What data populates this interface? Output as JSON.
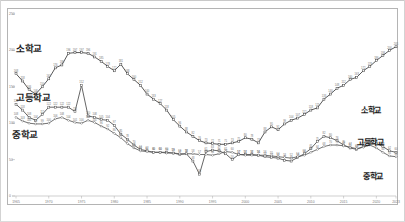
{
  "chart_data": {
    "type": "line",
    "title": "",
    "xlabel": "",
    "ylabel": "",
    "xlim": [
      1965,
      2023
    ],
    "ylim": [
      0,
      250
    ],
    "grid": false,
    "legend_position": "inline-endpoints",
    "x": [
      1965,
      1966,
      1967,
      1968,
      1969,
      1970,
      1971,
      1972,
      1973,
      1974,
      1975,
      1976,
      1977,
      1978,
      1979,
      1980,
      1981,
      1982,
      1983,
      1984,
      1985,
      1986,
      1987,
      1988,
      1989,
      1990,
      1991,
      1992,
      1993,
      1994,
      1995,
      1996,
      1997,
      1998,
      1999,
      2000,
      2001,
      2002,
      2003,
      2004,
      2005,
      2006,
      2007,
      2008,
      2009,
      2010,
      2011,
      2012,
      2013,
      2014,
      2015,
      2016,
      2017,
      2018,
      2019,
      2020,
      2021,
      2022,
      2023
    ],
    "x_tick_labels": [
      "1965",
      "1970",
      "1975",
      "1980",
      "1985",
      "1990",
      "1995",
      "2000",
      "2005",
      "2010",
      "2015",
      "2020",
      "2023"
    ],
    "y_tick_labels": [
      "0",
      "50",
      "100",
      "150",
      "200",
      "250"
    ],
    "y_ticks": [
      0,
      50,
      100,
      150,
      200,
      250
    ],
    "series": [
      {
        "name": "소학교",
        "label_left": "소학교",
        "label_right": "소학교",
        "color": "#3a3a3a",
        "marker": "square",
        "values": [
          168,
          158,
          146,
          140,
          150,
          161,
          176,
          180,
          196,
          197,
          197,
          196,
          191,
          185,
          178,
          172,
          181,
          168,
          160,
          152,
          140,
          133,
          127,
          118,
          105,
          96,
          88,
          82,
          76,
          73,
          72,
          71,
          71,
          73,
          75,
          80,
          78,
          73,
          88,
          95,
          91,
          99,
          104,
          107,
          112,
          118,
          121,
          133,
          140,
          148,
          152,
          160,
          163,
          172,
          178,
          186,
          193,
          200,
          205
        ]
      },
      {
        "name": "고등학교",
        "label_left": "고등학교",
        "label_right": "고등학교",
        "color": "#4a4a4a",
        "marker": "square",
        "values": [
          126,
          118,
          108,
          104,
          112,
          122,
          122,
          122,
          122,
          116,
          152,
          110,
          108,
          105,
          104,
          97,
          85,
          78,
          70,
          64,
          62,
          60,
          60,
          60,
          59,
          57,
          58,
          48,
          30,
          61,
          63,
          62,
          58,
          50,
          57,
          57,
          57,
          56,
          54,
          53,
          52,
          49,
          48,
          53,
          58,
          65,
          75,
          82,
          80,
          76,
          70,
          66,
          64,
          68,
          71,
          72,
          68,
          62,
          60
        ]
      },
      {
        "name": "중학교",
        "label_left": "중학교",
        "label_right": "중학교",
        "color": "#5a5a5a",
        "marker": "diamond",
        "values": [
          108,
          103,
          100,
          99,
          99,
          100,
          106,
          108,
          104,
          101,
          100,
          104,
          101,
          96,
          92,
          86,
          80,
          72,
          66,
          62,
          61,
          60,
          60,
          59,
          59,
          58,
          58,
          58,
          57,
          57,
          56,
          58,
          61,
          60,
          57,
          56,
          56,
          56,
          56,
          55,
          54,
          53,
          52,
          54,
          56,
          60,
          64,
          68,
          70,
          70,
          69,
          67,
          65,
          67,
          70,
          66,
          60,
          55,
          54
        ]
      }
    ],
    "annotations": {
      "left_tags": [
        "소학교",
        "고등학교",
        "중학교"
      ],
      "right_tags": [
        "소학교",
        "고등학교",
        "중학교"
      ]
    }
  },
  "axis": {
    "x_ticks": [
      "1965",
      "1970",
      "1975",
      "1980",
      "1985",
      "1990",
      "1995",
      "2000",
      "2005",
      "2010",
      "2015",
      "2020",
      "2023"
    ],
    "y_ticks": [
      "0",
      "50",
      "100",
      "150",
      "200",
      "250"
    ]
  }
}
